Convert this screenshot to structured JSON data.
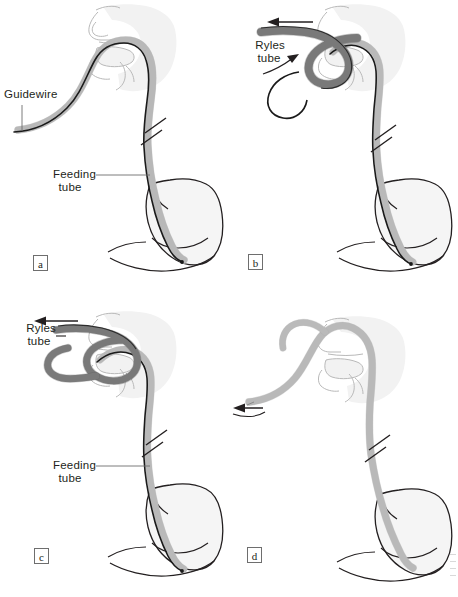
{
  "figure": {
    "background_color": "#ffffff",
    "ink_color": "#231f20",
    "anatomy_fill": "#f2f2f2",
    "anatomy_stroke": "#8c8c8c",
    "tube_fill": "#b5b5b5",
    "tube_stroke": "#6b6b6b",
    "guidewire_color": "#1a1a1a",
    "ryles_tube_fill": "#8f8f8f"
  },
  "panels": [
    {
      "id": "a",
      "letter": "a",
      "labels": [
        {
          "name": "guidewire",
          "text": "Guidewire",
          "lines": [
            "Guidewire"
          ]
        },
        {
          "name": "feeding-tube",
          "text": "Feeding tube",
          "lines": [
            "Feeding",
            "tube"
          ]
        }
      ],
      "arrows": [],
      "break_marks": 1
    },
    {
      "id": "b",
      "letter": "b",
      "labels": [
        {
          "name": "ryles-tube",
          "text": "Ryles tube",
          "lines": [
            "Ryles",
            "tube"
          ]
        }
      ],
      "arrows": [
        {
          "name": "withdraw-arrow",
          "direction": "left"
        },
        {
          "name": "loop-arrow",
          "direction": "up-right"
        }
      ],
      "break_marks": 1
    },
    {
      "id": "c",
      "letter": "c",
      "labels": [
        {
          "name": "ryles-tube",
          "text": "Ryles tube",
          "lines": [
            "Ryles",
            "tube"
          ]
        },
        {
          "name": "feeding-tube",
          "text": "Feeding tube",
          "lines": [
            "Feeding",
            "tube"
          ]
        }
      ],
      "arrows": [
        {
          "name": "withdraw-arrow",
          "direction": "left"
        }
      ],
      "break_marks": 1
    },
    {
      "id": "d",
      "letter": "d",
      "labels": [],
      "arrows": [
        {
          "name": "withdraw-arrow",
          "direction": "left"
        }
      ],
      "break_marks": 1
    }
  ],
  "text": {
    "guidewire": "Guidewire",
    "feeding_1": "Feeding",
    "feeding_2": "tube",
    "ryles_1": "Ryles",
    "ryles_2": "tube",
    "a": "a",
    "b": "b",
    "c": "c",
    "d": "d"
  }
}
